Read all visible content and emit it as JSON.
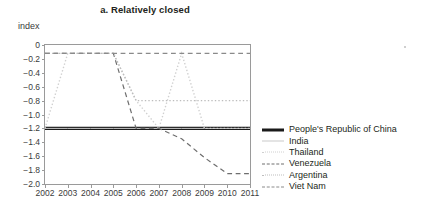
{
  "chart_data": {
    "type": "line",
    "title": "a. Relatively closed",
    "ylabel": "index",
    "xlabel": "",
    "ylim": [
      -2.0,
      0
    ],
    "xlim": [
      2002,
      2011
    ],
    "grid": false,
    "legend_position": "right",
    "x": [
      2002,
      2003,
      2004,
      2005,
      2006,
      2007,
      2008,
      2009,
      2010,
      2011
    ],
    "xtick_labels": [
      "2002",
      "2003",
      "2004",
      "2005",
      "2006",
      "2007",
      "2008",
      "2009",
      "2010",
      "2011"
    ],
    "ytick_labels": [
      "0",
      "−0.2",
      "−0.4",
      "−0.6",
      "−0.8",
      "−1.0",
      "−1.2",
      "−1.4",
      "−1.6",
      "−1.8",
      "−2.0"
    ],
    "ytick_values": [
      0,
      -0.2,
      -0.4,
      -0.6,
      -0.8,
      -1.0,
      -1.2,
      -1.4,
      -1.6,
      -1.8,
      -2.0
    ],
    "series": [
      {
        "name": "People's Republic of China",
        "style": "solid",
        "color": "#1a1a1a",
        "width": 3.2,
        "values": [
          -1.2,
          -1.2,
          -1.2,
          -1.2,
          -1.2,
          -1.2,
          -1.2,
          -1.2,
          -1.2,
          -1.2
        ]
      },
      {
        "name": "India",
        "style": "solid",
        "color": "#c9c9c9",
        "width": 1.0,
        "values": [
          -1.2,
          -1.2,
          -1.2,
          -1.2,
          -1.2,
          -1.2,
          -1.2,
          -1.2,
          -1.2,
          -1.2
        ]
      },
      {
        "name": "Thailand",
        "style": "dotted",
        "color": "#d0d0d0",
        "width": 1.4,
        "values": [
          -1.2,
          -0.12,
          -0.12,
          -0.12,
          -0.8,
          -1.2,
          -0.12,
          -1.2,
          -1.2,
          -1.2
        ]
      },
      {
        "name": "Venezuela",
        "style": "dashed",
        "color": "#6e6e6e",
        "width": 1.2,
        "values": [
          -0.12,
          -0.12,
          -0.12,
          -0.12,
          -1.2,
          -1.2,
          -1.35,
          -1.62,
          -1.85,
          -1.85
        ]
      },
      {
        "name": "Argentina",
        "style": "dotted",
        "color": "#bdbdbd",
        "width": 1.4,
        "values": [
          -0.12,
          -0.12,
          -0.12,
          -0.12,
          -0.8,
          -0.8,
          -0.8,
          -0.8,
          -0.8,
          -0.8
        ]
      },
      {
        "name": "Viet Nam",
        "style": "dashed",
        "color": "#8a8a8a",
        "width": 1.2,
        "values": [
          -0.12,
          -0.12,
          -0.12,
          -0.12,
          -0.12,
          -0.12,
          -0.12,
          -0.12,
          -0.12,
          -0.12
        ]
      }
    ],
    "legend": [
      {
        "label": "People's Republic of China",
        "swatch": "sw-prc"
      },
      {
        "label": "India",
        "swatch": "sw-india"
      },
      {
        "label": "Thailand",
        "swatch": "sw-thailand"
      },
      {
        "label": "Venezuela",
        "swatch": "sw-venezuela"
      },
      {
        "label": "Argentina",
        "swatch": "sw-argentina"
      },
      {
        "label": "Viet Nam",
        "swatch": "sw-vietnam"
      }
    ]
  }
}
